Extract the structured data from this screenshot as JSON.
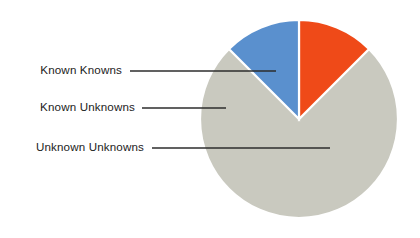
{
  "chart_data": {
    "type": "pie",
    "title": "",
    "subtitle": "",
    "xlabel": "",
    "ylabel": "",
    "legend_position": "none",
    "grid": false,
    "start_angle_deg": 0,
    "direction": "clockwise",
    "categories": [
      "Known Knowns",
      "Known Unknowns",
      "Unknown Unknowns"
    ],
    "values": [
      12.5,
      12.5,
      75
    ],
    "colors": [
      "#ef4a18",
      "#5a90ce",
      "#c9c9bf"
    ],
    "slices": [
      {
        "label": "Known Knowns",
        "value": 12.5,
        "percent": "12.5%",
        "color": "#ef4a18",
        "start_deg": 0,
        "end_deg": 45
      },
      {
        "label": "Known Unknowns",
        "value": 12.5,
        "percent": "12.5%",
        "color": "#5a90ce",
        "start_deg": 315,
        "end_deg": 360
      },
      {
        "label": "Unknown Unknowns",
        "value": 75,
        "percent": "75%",
        "color": "#c9c9bf",
        "start_deg": 45,
        "end_deg": 315
      }
    ],
    "annotations": [
      {
        "text": "Known Knowns",
        "text_x": 122,
        "text_y": 71,
        "line_x1": 130,
        "line_y1": 71,
        "line_x2": 276,
        "line_y2": 71
      },
      {
        "text": "Known Unknowns",
        "text_x": 135,
        "text_y": 108,
        "line_x1": 142,
        "line_y1": 108,
        "line_x2": 226,
        "line_y2": 108
      },
      {
        "text": "Unknown Unknowns",
        "text_x": 144,
        "text_y": 148,
        "line_x1": 152,
        "line_y1": 148,
        "line_x2": 330,
        "line_y2": 148
      }
    ],
    "geometry": {
      "center_x": 299,
      "center_y": 119,
      "radius": 99
    },
    "background_color": "#ffffff",
    "leader_line_color": "#2d2d2d",
    "label_text_color": "#1c1c1c"
  },
  "figure": {
    "caption": "",
    "width": 420,
    "height": 238
  }
}
